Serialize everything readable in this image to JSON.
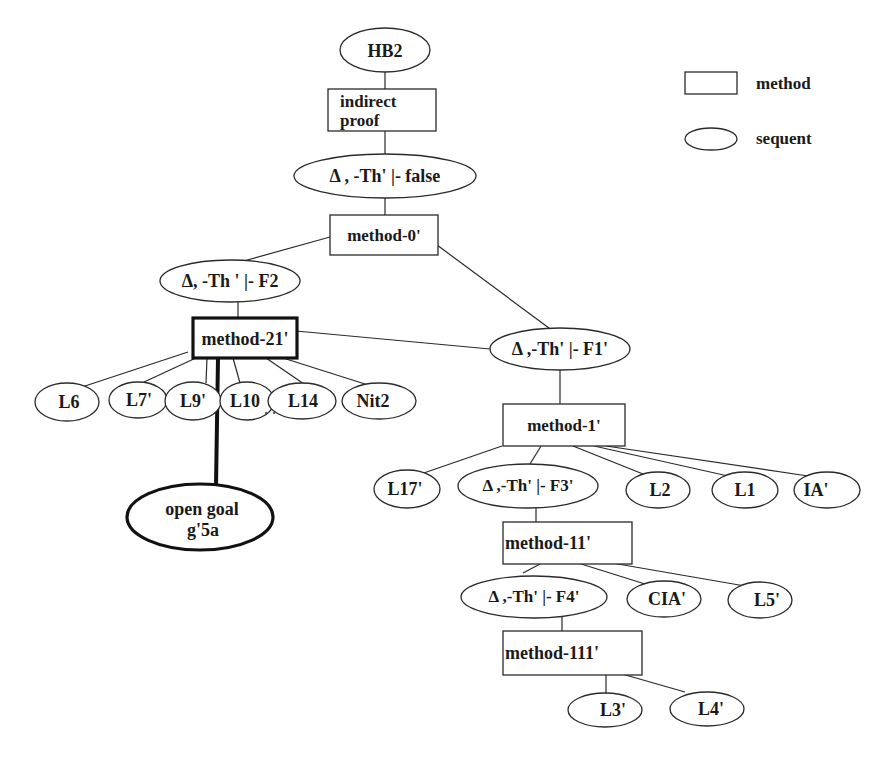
{
  "legend": {
    "method_label": "method",
    "sequent_label": "sequent"
  },
  "nodes": {
    "hb2": "HB2",
    "indirect_proof_1": "indirect",
    "indirect_proof_2": "proof",
    "seq_false": "Δ , -Th' |- false",
    "method_0": "method-0'",
    "seq_f2": "Δ, -Th ' |- F2",
    "method_21": "method-21'",
    "seq_f1": "Δ ,-Th' |- F1'",
    "l6": "L6",
    "l7": "L7'",
    "l9": "L9'",
    "l10": "L10",
    "ellipsis": ". . .",
    "l14": "L14",
    "nit2": "Nit2",
    "open_goal_1": "open goal",
    "open_goal_2": "g'5a",
    "method_1": "method-1'",
    "l17": "L17'",
    "seq_f3": "Δ ,-Th' |- F3'",
    "l2": "L2",
    "l1": "L1",
    "ia": "IA'",
    "method_11": "method-11'",
    "seq_f4": "Δ ,-Th' |- F4'",
    "cia": "CIA'",
    "l5": "L5'",
    "method_111": "method-111'",
    "l3": "L3'",
    "l4": "L4'"
  }
}
